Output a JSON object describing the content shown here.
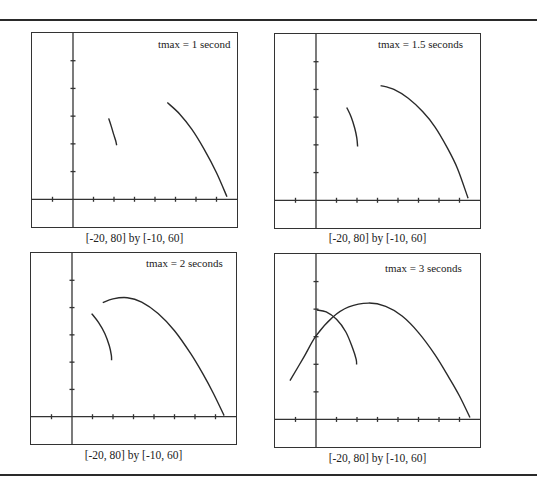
{
  "chart_data": [
    {
      "type": "line",
      "title": "tmax = 1 second",
      "window": "[-20, 80] by [-10, 60]",
      "xlim": [
        -20,
        80
      ],
      "ylim": [
        -10,
        60
      ],
      "x_tick_step": 10,
      "y_tick_step": 10,
      "grid": false,
      "series": [
        {
          "name": "arc-1",
          "points": [
            [
              17.4,
              29.2
            ],
            [
              18.6,
              26.5
            ],
            [
              19.8,
              23.5
            ],
            [
              20.8,
              21.2
            ],
            [
              21.3,
              19.5
            ]
          ]
        },
        {
          "name": "trajectory",
          "points": [
            [
              46.0,
              34.9
            ],
            [
              52.0,
              30.8
            ],
            [
              58.0,
              25.2
            ],
            [
              64.0,
              18.0
            ],
            [
              70.0,
              9.6
            ],
            [
              75.1,
              0.9
            ]
          ]
        }
      ]
    },
    {
      "type": "line",
      "title": "tmax = 1.5 seconds",
      "window": "[-20, 80] by [-10, 60]",
      "xlim": [
        -20,
        80
      ],
      "ylim": [
        -10,
        60
      ],
      "x_tick_step": 10,
      "y_tick_step": 10,
      "grid": false,
      "series": [
        {
          "name": "arc-1",
          "points": [
            [
              15.0,
              33.5
            ],
            [
              17.2,
              30.0
            ],
            [
              18.9,
              26.0
            ],
            [
              19.9,
              22.5
            ],
            [
              20.3,
              19.4
            ]
          ]
        },
        {
          "name": "trajectory",
          "points": [
            [
              31.5,
              41.4
            ],
            [
              38.0,
              40.0
            ],
            [
              45.0,
              36.8
            ],
            [
              52.0,
              32.0
            ],
            [
              58.0,
              26.5
            ],
            [
              64.0,
              19.0
            ],
            [
              69.0,
              11.5
            ],
            [
              74.2,
              0.7
            ]
          ]
        }
      ]
    },
    {
      "type": "line",
      "title": "tmax = 2 seconds",
      "window": "[-20, 80] by [-10, 60]",
      "xlim": [
        -20,
        80
      ],
      "ylim": [
        -10,
        60
      ],
      "x_tick_step": 10,
      "y_tick_step": 10,
      "grid": false,
      "series": [
        {
          "name": "arc-1",
          "points": [
            [
              9.6,
              37.8
            ],
            [
              13.0,
              34.5
            ],
            [
              16.0,
              30.5
            ],
            [
              18.2,
              26.0
            ],
            [
              19.2,
              22.5
            ],
            [
              19.3,
              20.7
            ]
          ]
        },
        {
          "name": "trajectory",
          "points": [
            [
              15.0,
              41.8
            ],
            [
              20.0,
              43.2
            ],
            [
              27.0,
              43.6
            ],
            [
              34.0,
              42.0
            ],
            [
              42.0,
              37.8
            ],
            [
              50.0,
              31.5
            ],
            [
              58.0,
              23.0
            ],
            [
              64.0,
              15.5
            ],
            [
              69.0,
              8.5
            ],
            [
              74.2,
              0.4
            ]
          ]
        }
      ]
    },
    {
      "type": "line",
      "title": "tmax = 3 seconds",
      "window": "[-20, 80] by [-10, 60]",
      "xlim": [
        -20,
        80
      ],
      "ylim": [
        -10,
        60
      ],
      "x_tick_step": 10,
      "y_tick_step": 10,
      "grid": false,
      "series": [
        {
          "name": "arc-1",
          "points": [
            [
              0.4,
              39.7
            ],
            [
              5.0,
              39.0
            ],
            [
              10.0,
              36.3
            ],
            [
              14.5,
              31.8
            ],
            [
              17.8,
              26.0
            ],
            [
              19.6,
              21.8
            ],
            [
              19.8,
              19.9
            ]
          ]
        },
        {
          "name": "trajectory",
          "points": [
            [
              -12.7,
              14.1
            ],
            [
              -6.0,
              22.5
            ],
            [
              0.0,
              30.3
            ],
            [
              8.0,
              37.0
            ],
            [
              16.0,
              40.8
            ],
            [
              25.6,
              42.2
            ],
            [
              34.0,
              41.0
            ],
            [
              42.0,
              37.5
            ],
            [
              50.0,
              31.5
            ],
            [
              58.0,
              23.5
            ],
            [
              65.0,
              15.0
            ],
            [
              70.0,
              8.5
            ],
            [
              75.1,
              0.7
            ]
          ]
        }
      ]
    }
  ],
  "panels": [
    {
      "title": "tmax = 1 second",
      "caption": "[-20, 80] by [-10, 60]"
    },
    {
      "title": "tmax = 1.5 seconds",
      "caption": "[-20, 80] by [-10, 60]"
    },
    {
      "title": "tmax = 2 seconds",
      "caption": "[-20, 80] by [-10, 60]"
    },
    {
      "title": "tmax = 3 seconds",
      "caption": "[-20, 80] by [-10, 60]"
    }
  ]
}
